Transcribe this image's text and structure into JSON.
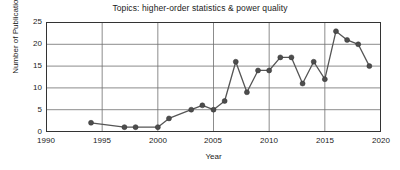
{
  "chart_data": {
    "type": "line",
    "title": "Topics: higher-order statistics & power quality",
    "xlabel": "Year",
    "ylabel": "Number of Publication",
    "xlim": [
      1990,
      2020
    ],
    "ylim": [
      0,
      25
    ],
    "xticks": [
      1990,
      1995,
      2000,
      2005,
      2010,
      2015,
      2020
    ],
    "yticks": [
      0,
      5,
      10,
      15,
      20,
      25
    ],
    "grid": true,
    "legend": "none",
    "marker": "circle",
    "line_color": "#555555",
    "marker_color": "#4d4d4d",
    "x": [
      1994,
      1997,
      1998,
      2000,
      2001,
      2003,
      2004,
      2005,
      2006,
      2007,
      2008,
      2009,
      2010,
      2011,
      2012,
      2013,
      2014,
      2015,
      2016,
      2017,
      2018,
      2019
    ],
    "values": [
      2,
      1,
      1,
      1,
      3,
      5,
      6,
      5,
      7,
      16,
      9,
      14,
      14,
      17,
      17,
      11,
      16,
      12,
      23,
      21,
      20,
      15
    ],
    "series": [
      {
        "name": "Number of Publication",
        "x": [
          1994,
          1997,
          1998,
          2000,
          2001,
          2003,
          2004,
          2005,
          2006,
          2007,
          2008,
          2009,
          2010,
          2011,
          2012,
          2013,
          2014,
          2015,
          2016,
          2017,
          2018,
          2019
        ],
        "values": [
          2,
          1,
          1,
          1,
          3,
          5,
          6,
          5,
          7,
          16,
          9,
          14,
          14,
          17,
          17,
          11,
          16,
          12,
          23,
          21,
          20,
          15
        ]
      }
    ]
  },
  "axis": {
    "ytick_labels": [
      "25",
      "20",
      "15",
      "10",
      "5",
      "0"
    ],
    "xtick_labels": [
      "1990",
      "1995",
      "2000",
      "2005",
      "2010",
      "2015",
      "2020"
    ]
  }
}
